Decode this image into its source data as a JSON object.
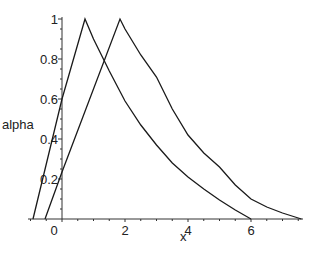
{
  "chart_data": {
    "type": "line",
    "title": "",
    "xlabel": "x",
    "ylabel": "alpha",
    "xlim": [
      -1.1,
      7.7
    ],
    "ylim": [
      0,
      1
    ],
    "grid": false,
    "legend": null,
    "x_ticks": [
      0,
      2,
      4,
      6
    ],
    "x_tick_labels": [
      "0",
      "2",
      "4",
      "6"
    ],
    "y_ticks": [
      0.2,
      0.4,
      0.6,
      0.8,
      1
    ],
    "y_tick_labels": [
      "0.2",
      "0.4",
      "0.6",
      "0.8",
      "1"
    ],
    "series": [
      {
        "name": "curve 1",
        "x": [
          -0.92,
          0,
          0.73,
          1.0,
          1.5,
          2.0,
          2.5,
          3.0,
          3.5,
          4.0,
          4.5,
          5.0,
          5.5,
          6.0
        ],
        "y": [
          0,
          0.6,
          1.0,
          0.9,
          0.74,
          0.59,
          0.47,
          0.37,
          0.28,
          0.21,
          0.15,
          0.095,
          0.045,
          0
        ]
      },
      {
        "name": "curve 2",
        "x": [
          -0.54,
          0,
          1.84,
          2.0,
          2.5,
          3.0,
          3.5,
          4.0,
          4.5,
          5.0,
          5.5,
          6.0,
          6.5,
          7.0,
          7.6
        ],
        "y": [
          0,
          0.235,
          1.0,
          0.95,
          0.82,
          0.71,
          0.55,
          0.42,
          0.33,
          0.26,
          0.17,
          0.1,
          0.06,
          0.03,
          0
        ]
      }
    ]
  },
  "plot_area": {
    "x0_px": 62,
    "px_per_x": 31.5,
    "y0_px": 219,
    "px_per_y": 200,
    "axis_x_start_px": 28,
    "axis_x_end_px": 303,
    "axis_y_top_px": 17
  },
  "labels": {
    "x_axis_title": "x",
    "y_axis_title": "alpha"
  },
  "colors": {
    "line": "#1a1a1a",
    "axis": "#333333"
  }
}
